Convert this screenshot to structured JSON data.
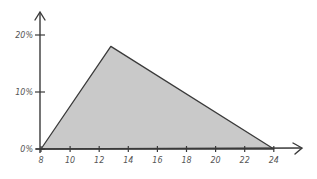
{
  "chart_data": {
    "type": "area",
    "title": "",
    "xlabel": "",
    "ylabel": "",
    "x": [
      8,
      12.8,
      24
    ],
    "series": [
      {
        "name": "",
        "values": [
          0,
          18,
          0
        ]
      }
    ],
    "x_ticks": [
      8,
      10,
      12,
      14,
      16,
      18,
      20,
      22,
      24
    ],
    "x_tick_labels": [
      "8",
      "10",
      "12",
      "14",
      "16",
      "18",
      "20",
      "22",
      "24"
    ],
    "y_ticks": [
      0,
      10,
      20
    ],
    "y_tick_labels": [
      "0%",
      "10%",
      "20%"
    ],
    "xlim": [
      8,
      26
    ],
    "ylim": [
      0,
      23
    ],
    "grid": false,
    "legend": "none",
    "style": "hand-drawn",
    "colors": {
      "fill": "#c9c9c9",
      "stroke": "#3a3a3a",
      "axis": "#3a3a3a",
      "label": "#555555"
    }
  }
}
